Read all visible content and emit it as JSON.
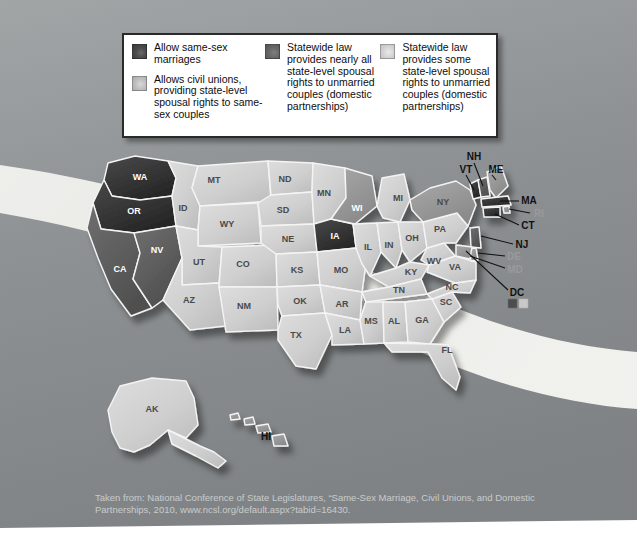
{
  "slide": {
    "title_bar": "",
    "background_color": "#8b8e90"
  },
  "legend": {
    "items": [
      {
        "swatch": "dark",
        "swatch_color": "#434343",
        "text": "Allow same-sex marriages"
      },
      {
        "swatch": "light",
        "swatch_color": "#c4c4c4",
        "text": "Allows civil unions, providing state-level spousal rights to same-sex couples"
      },
      {
        "swatch": "mid",
        "swatch_color": "#5e5e5e",
        "text": "Statewide law provides nearly all state-level spousal rights to unmarried couples (domestic partnerships)"
      },
      {
        "swatch": "lighter",
        "swatch_color": "#d4d4d4",
        "text": "Statewide law provides some state-level spousal rights to unmarried couples (domestic partnerships)"
      }
    ]
  },
  "map": {
    "states": [
      {
        "code": "WA",
        "category": "marriage",
        "label_on_dark": true
      },
      {
        "code": "OR",
        "category": "marriage",
        "label_on_dark": true
      },
      {
        "code": "CA",
        "category": "civil-union",
        "label_on_dark": true
      },
      {
        "code": "NV",
        "category": "civil-union",
        "label_on_dark": true
      },
      {
        "code": "ID",
        "category": "none",
        "label_on_dark": false
      },
      {
        "code": "MT",
        "category": "none",
        "label_on_dark": false
      },
      {
        "code": "WY",
        "category": "none",
        "label_on_dark": false
      },
      {
        "code": "UT",
        "category": "none",
        "label_on_dark": false
      },
      {
        "code": "AZ",
        "category": "none",
        "label_on_dark": false
      },
      {
        "code": "CO",
        "category": "none",
        "label_on_dark": false
      },
      {
        "code": "NM",
        "category": "none",
        "label_on_dark": false
      },
      {
        "code": "ND",
        "category": "none",
        "label_on_dark": false
      },
      {
        "code": "SD",
        "category": "none",
        "label_on_dark": false
      },
      {
        "code": "NE",
        "category": "none",
        "label_on_dark": false
      },
      {
        "code": "KS",
        "category": "none",
        "label_on_dark": false
      },
      {
        "code": "OK",
        "category": "none",
        "label_on_dark": false
      },
      {
        "code": "TX",
        "category": "none",
        "label_on_dark": false
      },
      {
        "code": "MN",
        "category": "none",
        "label_on_dark": false
      },
      {
        "code": "IA",
        "category": "marriage",
        "label_on_dark": true
      },
      {
        "code": "MO",
        "category": "none",
        "label_on_dark": false
      },
      {
        "code": "AR",
        "category": "none",
        "label_on_dark": false
      },
      {
        "code": "LA",
        "category": "none",
        "label_on_dark": false
      },
      {
        "code": "WI",
        "category": "partial",
        "label_on_dark": true
      },
      {
        "code": "IL",
        "category": "none",
        "label_on_dark": false
      },
      {
        "code": "MI",
        "category": "none",
        "label_on_dark": false
      },
      {
        "code": "IN",
        "category": "none",
        "label_on_dark": false
      },
      {
        "code": "OH",
        "category": "none",
        "label_on_dark": false
      },
      {
        "code": "KY",
        "category": "none",
        "label_on_dark": false
      },
      {
        "code": "TN",
        "category": "none",
        "label_on_dark": false
      },
      {
        "code": "MS",
        "category": "none",
        "label_on_dark": false
      },
      {
        "code": "AL",
        "category": "none",
        "label_on_dark": false
      },
      {
        "code": "GA",
        "category": "none",
        "label_on_dark": false
      },
      {
        "code": "FL",
        "category": "none",
        "label_on_dark": false
      },
      {
        "code": "SC",
        "category": "none",
        "label_on_dark": false
      },
      {
        "code": "NC",
        "category": "none",
        "label_on_dark": false
      },
      {
        "code": "VA",
        "category": "none",
        "label_on_dark": false
      },
      {
        "code": "WV",
        "category": "none",
        "label_on_dark": false
      },
      {
        "code": "PA",
        "category": "none",
        "label_on_dark": false
      },
      {
        "code": "NY",
        "category": "partial",
        "label_on_dark": false
      },
      {
        "code": "AK",
        "category": "none",
        "label_on_dark": false
      }
    ],
    "callouts": [
      {
        "code": "NH",
        "category": "civil-union"
      },
      {
        "code": "VT",
        "category": "marriage"
      },
      {
        "code": "ME",
        "category": "partial"
      },
      {
        "code": "MA",
        "category": "marriage"
      },
      {
        "code": "RI",
        "category": "partial"
      },
      {
        "code": "CT",
        "category": "marriage"
      },
      {
        "code": "NJ",
        "category": "civil-union"
      },
      {
        "code": "DE",
        "category": "partial"
      },
      {
        "code": "MD",
        "category": "partial"
      },
      {
        "code": "DC",
        "category": "marriage"
      },
      {
        "code": "HI",
        "category": "partial"
      }
    ],
    "dc_swatches": [
      "#4d4d4d",
      "#c9c9c9"
    ]
  },
  "caption": {
    "line1": "Taken from: National Conference of State Legislatures, “Same-Sex Marriage, Civil Unions, and Domestic",
    "line2": "Partnerships, 2010, www.ncsl.org/default.aspx?tabid=16430."
  }
}
